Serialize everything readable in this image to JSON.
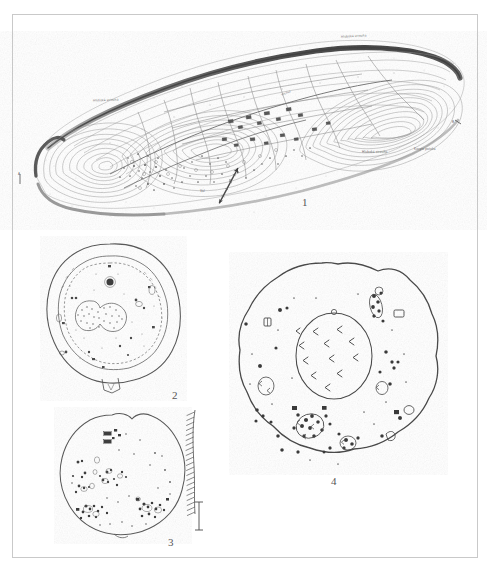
{
  "plate": {
    "kind": "archaeological-site-plans-plate",
    "background_color": "#ffffff",
    "frame_color": "#c9c9c9",
    "ink_color": "#3a3a3a"
  },
  "figures": [
    {
      "number": "1",
      "title": "",
      "type": "contour-survey-plan",
      "description": "elongated promontory hillfort with contour lines, ramparts and internal features",
      "label_x": 302,
      "label_y": 196
    },
    {
      "number": "2",
      "title": "",
      "type": "oval-enclosure-plan",
      "description": "oval enclosure with outer rampart, inner dashed ditch line and central stippled mound",
      "label_x": 172,
      "label_y": 389
    },
    {
      "number": "3",
      "title": "",
      "type": "rounded-enclosure-plan",
      "description": "rounded enclosure with scattered features and hachured scarp on east side",
      "label_x": 168,
      "label_y": 536
    },
    {
      "number": "4",
      "title": "",
      "type": "circular-enclosure-plan",
      "description": "circular enclosure with central oval stone setting and scattered features",
      "label_x": 331,
      "label_y": 475
    }
  ],
  "map_labels": [
    {
      "text": "Hluboká strouha",
      "x": 341,
      "y": 34,
      "rotate": -3
    },
    {
      "text": "Hluboká strouha",
      "x": 93,
      "y": 98,
      "rotate": -2
    },
    {
      "text": "Hluboká strouha",
      "x": 362,
      "y": 150,
      "rotate": 0
    },
    {
      "text": "Koryto potoka",
      "x": 414,
      "y": 147,
      "rotate": 0
    },
    {
      "text": "Vrchol",
      "x": 281,
      "y": 91,
      "rotate": -20
    },
    {
      "text": "Val",
      "x": 200,
      "y": 189,
      "rotate": 0
    },
    {
      "text": "A",
      "x": 18,
      "y": 172,
      "rotate": 0
    },
    {
      "text": "B",
      "x": 452,
      "y": 120,
      "rotate": 0
    }
  ],
  "scale_bars": [
    {
      "figure": "1",
      "orientation": "diagonal",
      "x": 238,
      "y": 168
    },
    {
      "figure": "3",
      "orientation": "vertical",
      "x": 198,
      "y": 500,
      "top_tick": "0",
      "bottom_tick": "m"
    }
  ]
}
